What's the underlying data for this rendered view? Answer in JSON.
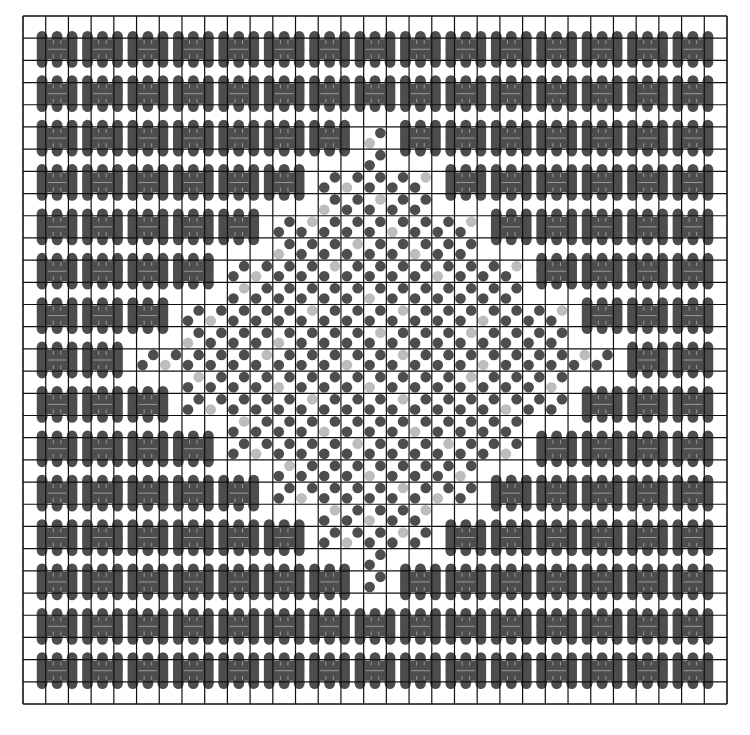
{
  "board": {
    "label": "Puzzle board",
    "cols": 31,
    "rows": 31,
    "origin": [
      23,
      16
    ],
    "extent": [
      727,
      704
    ],
    "colors": {
      "background": "#ffffff",
      "grid_line": "#111111",
      "dark_piece": "#4d4d4d",
      "light_piece": "#bdbdbd",
      "brick_line": "#9a9a9a"
    },
    "flower_rows": {
      "1": [
        1,
        3,
        5,
        7,
        9,
        11,
        13,
        15,
        17,
        19,
        21,
        23,
        25,
        27,
        29
      ],
      "3": [
        1,
        3,
        5,
        7,
        9,
        11,
        13,
        15,
        17,
        19,
        21,
        23,
        25,
        27,
        29
      ],
      "5": [
        1,
        3,
        5,
        7,
        9,
        11,
        13,
        17,
        19,
        21,
        23,
        25,
        27,
        29
      ],
      "7": [
        1,
        3,
        5,
        7,
        9,
        11,
        19,
        21,
        23,
        25,
        27,
        29
      ],
      "9": [
        1,
        3,
        5,
        7,
        9,
        21,
        23,
        25,
        27,
        29
      ],
      "11": [
        1,
        3,
        5,
        7,
        23,
        25,
        27,
        29
      ],
      "13": [
        1,
        3,
        5,
        25,
        27,
        29
      ],
      "15": [
        1,
        3,
        27,
        29
      ],
      "17": [
        1,
        3,
        5,
        25,
        27,
        29
      ],
      "19": [
        1,
        3,
        5,
        7,
        23,
        25,
        27,
        29
      ],
      "21": [
        1,
        3,
        5,
        7,
        9,
        21,
        23,
        25,
        27,
        29
      ],
      "23": [
        1,
        3,
        5,
        7,
        9,
        11,
        19,
        21,
        23,
        25,
        27,
        29
      ],
      "25": [
        1,
        3,
        5,
        7,
        9,
        11,
        13,
        17,
        19,
        21,
        23,
        25,
        27,
        29
      ],
      "27": [
        1,
        3,
        5,
        7,
        9,
        11,
        13,
        15,
        17,
        19,
        21,
        23,
        25,
        27,
        29
      ],
      "29": [
        1,
        3,
        5,
        7,
        9,
        11,
        13,
        15,
        17,
        19,
        21,
        23,
        25,
        27,
        29
      ]
    },
    "light_dots": [
      [
        15,
        5,
        "bl"
      ],
      [
        16,
        6,
        "tr"
      ],
      [
        14,
        7,
        "bl"
      ],
      [
        17,
        7,
        "tr"
      ],
      [
        13,
        8,
        "bl"
      ],
      [
        15,
        8,
        "tr"
      ],
      [
        18,
        8,
        "bl"
      ],
      [
        12,
        9,
        "tr"
      ],
      [
        16,
        9,
        "bl"
      ],
      [
        19,
        9,
        "tr"
      ],
      [
        11,
        10,
        "bl"
      ],
      [
        14,
        10,
        "tr"
      ],
      [
        17,
        10,
        "bl"
      ],
      [
        20,
        10,
        "tr"
      ],
      [
        10,
        11,
        "bl"
      ],
      [
        13,
        11,
        "tr"
      ],
      [
        18,
        11,
        "bl"
      ],
      [
        21,
        11,
        "tr"
      ],
      [
        9,
        12,
        "tr"
      ],
      [
        15,
        12,
        "bl"
      ],
      [
        22,
        12,
        "bl"
      ],
      [
        8,
        13,
        "bl"
      ],
      [
        12,
        13,
        "tr"
      ],
      [
        16,
        13,
        "tr"
      ],
      [
        20,
        13,
        "bl"
      ],
      [
        23,
        13,
        "tr"
      ],
      [
        7,
        14,
        "bl"
      ],
      [
        11,
        14,
        "bl"
      ],
      [
        15,
        14,
        "tr"
      ],
      [
        19,
        14,
        "tr"
      ],
      [
        24,
        14,
        "bl"
      ],
      [
        6,
        15,
        "bl"
      ],
      [
        10,
        15,
        "tr"
      ],
      [
        14,
        15,
        "bl"
      ],
      [
        16,
        15,
        "tr"
      ],
      [
        20,
        15,
        "bl"
      ],
      [
        24,
        15,
        "tr"
      ],
      [
        7,
        16,
        "tr"
      ],
      [
        11,
        16,
        "bl"
      ],
      [
        15,
        16,
        "bl"
      ],
      [
        19,
        16,
        "tr"
      ],
      [
        23,
        16,
        "bl"
      ],
      [
        8,
        17,
        "bl"
      ],
      [
        12,
        17,
        "tr"
      ],
      [
        16,
        17,
        "tr"
      ],
      [
        21,
        17,
        "bl"
      ],
      [
        24,
        17,
        "tr"
      ],
      [
        9,
        18,
        "tr"
      ],
      [
        13,
        18,
        "bl"
      ],
      [
        17,
        18,
        "bl"
      ],
      [
        22,
        18,
        "tr"
      ],
      [
        10,
        19,
        "bl"
      ],
      [
        14,
        19,
        "tr"
      ],
      [
        18,
        19,
        "tr"
      ],
      [
        21,
        19,
        "bl"
      ],
      [
        11,
        20,
        "tr"
      ],
      [
        15,
        20,
        "bl"
      ],
      [
        19,
        20,
        "bl"
      ],
      [
        20,
        20,
        "tr"
      ],
      [
        12,
        21,
        "bl"
      ],
      [
        16,
        21,
        "tr"
      ],
      [
        18,
        21,
        "bl"
      ],
      [
        13,
        22,
        "tr"
      ],
      [
        15,
        22,
        "bl"
      ],
      [
        17,
        22,
        "tr"
      ],
      [
        14,
        23,
        "bl"
      ],
      [
        16,
        23,
        "tr"
      ],
      [
        14,
        24,
        "tr"
      ],
      [
        16,
        25,
        "bl"
      ]
    ]
  }
}
